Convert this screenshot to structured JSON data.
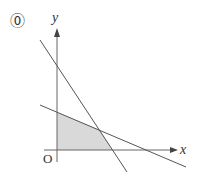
{
  "problem_label": "⓪",
  "axes": {
    "x_label": "x",
    "y_label": "y",
    "origin_label": "O"
  },
  "colors": {
    "line": "#555555",
    "axis": "#666666",
    "shade": "#d9d9d9"
  },
  "figure": {
    "lines": [
      {
        "name": "steep-line"
      },
      {
        "name": "shallow-line"
      }
    ],
    "shaded_region": "quadrilateral: origin, y-intercept of shallow line, intersection point, x-intercept of steep line"
  }
}
